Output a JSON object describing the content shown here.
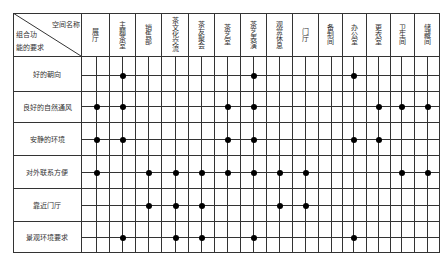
{
  "corner": {
    "top_right": "空间名称",
    "bottom_left_1": "组合功",
    "bottom_left_2": "能的要求"
  },
  "columns": [
    {
      "label": "展厅",
      "x": 96
    },
    {
      "label": "主题茶室",
      "x": 122
    },
    {
      "label": "销售部",
      "x": 148
    },
    {
      "label": "茶文化交流",
      "x": 175
    },
    {
      "label": "茶友聚会",
      "x": 201
    },
    {
      "label": "茶艺室",
      "x": 227
    },
    {
      "label": "茶艺表演",
      "x": 253
    },
    {
      "label": "观赏休息",
      "x": 279
    },
    {
      "label": "门厅",
      "x": 305
    },
    {
      "label": "备制间",
      "x": 331
    },
    {
      "label": "办公室",
      "x": 353
    },
    {
      "label": "更衣室",
      "x": 378
    },
    {
      "label": "卫生间",
      "x": 401
    },
    {
      "label": "储藏间",
      "x": 427
    }
  ],
  "rows": [
    {
      "label": "好的朝向",
      "y": 75,
      "dots": [
        1,
        6,
        10
      ]
    },
    {
      "label": "良好的自然通风",
      "y": 106,
      "dots": [
        0,
        1,
        5,
        6,
        11,
        12,
        13
      ]
    },
    {
      "label": "安静的环境",
      "y": 139,
      "dots": [
        0,
        1,
        5,
        6,
        10,
        11
      ]
    },
    {
      "label": "对外联系方便",
      "y": 172,
      "dots": [
        0,
        2,
        3,
        4,
        5,
        6,
        7,
        8,
        12,
        13
      ]
    },
    {
      "label": "靠近门厅",
      "y": 205,
      "dots": [
        2,
        3,
        4,
        7,
        8
      ]
    },
    {
      "label": "景观环境要求",
      "y": 237,
      "dots": [
        1,
        3,
        4,
        6,
        10
      ]
    }
  ],
  "header_dividers_x": [
    81,
    109,
    135,
    161,
    188,
    214,
    240,
    266,
    292,
    318,
    342,
    366,
    390,
    414
  ],
  "row_dividers_y": [
    56,
    91,
    122,
    155,
    188,
    221
  ],
  "colors": {
    "line": "#333333",
    "dot": "#000000"
  }
}
